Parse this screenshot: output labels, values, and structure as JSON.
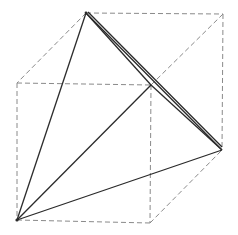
{
  "figure": {
    "title": "",
    "colors": {
      "background": "#ffffff",
      "cube_edges": "#8a8a8a",
      "tetra_edges": "#2a2a2a"
    },
    "cube_vertices": {
      "top_back_left": [
        86,
        13
      ],
      "top_back_right": [
        223,
        14
      ],
      "top_front_left": [
        17,
        83
      ],
      "top_front_right": [
        151,
        85
      ],
      "bottom_back_right": [
        222,
        150
      ],
      "bottom_front_left": [
        17,
        220
      ],
      "bottom_front_right": [
        150,
        223
      ]
    },
    "tetrahedron_vertices": [
      "top_back_left",
      "top_front_right",
      "bottom_back_right",
      "bottom_front_left"
    ]
  }
}
